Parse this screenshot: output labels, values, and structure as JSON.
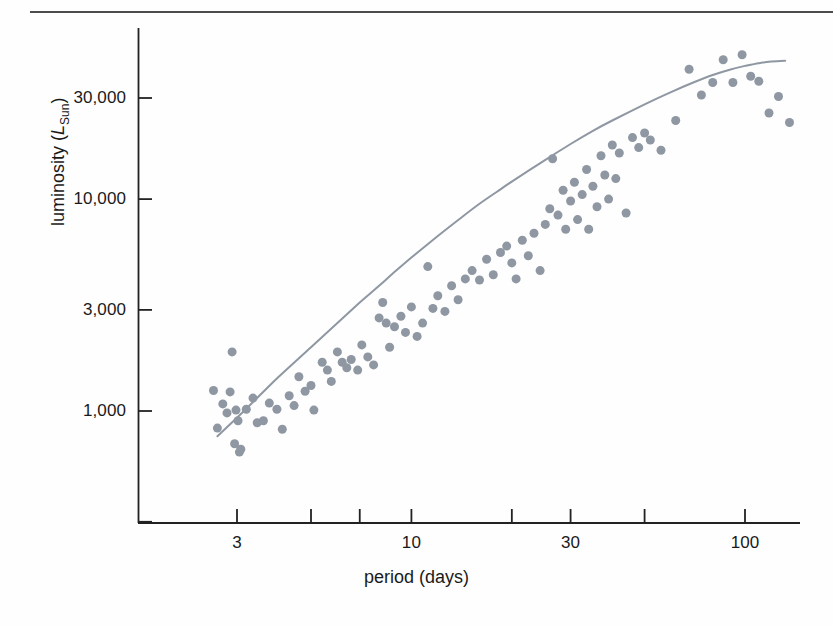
{
  "figure": {
    "kind": "scatter-plot",
    "background": "#fefefe",
    "rule_color": "#4c4c4c",
    "axis_color": "#222222",
    "point_color": "#8e97a2",
    "curve_color": "#8e97a2"
  },
  "axes": {
    "x_title": "period (days)",
    "y_title_prefix": "luminosity (",
    "y_title_symbol": "L",
    "y_title_subscript": "Sun",
    "y_title_suffix": ")"
  },
  "chart_data": {
    "type": "scatter",
    "title": "",
    "subtitle": "",
    "xlabel": "period (days)",
    "ylabel": "luminosity (L_Sun)",
    "xscale": "log",
    "yscale": "log",
    "xlim": [
      2.0,
      160
    ],
    "ylim": [
      330,
      120000
    ],
    "grid": false,
    "legend": null,
    "annotations": [],
    "xticks": [
      {
        "value": 3,
        "label": "3"
      },
      {
        "value": 5,
        "label": ""
      },
      {
        "value": 7,
        "label": ""
      },
      {
        "value": 10,
        "label": "10"
      },
      {
        "value": 20,
        "label": ""
      },
      {
        "value": 30,
        "label": "30"
      },
      {
        "value": 50,
        "label": ""
      },
      {
        "value": 100,
        "label": "100"
      }
    ],
    "yticks": [
      {
        "value": 100000,
        "label": ""
      },
      {
        "value": 30000,
        "label": "30,000"
      },
      {
        "value": 10000,
        "label": "10,000"
      },
      {
        "value": 3000,
        "label": "3,000"
      },
      {
        "value": 1000,
        "label": "1,000"
      },
      {
        "value": 300,
        "label": ""
      }
    ],
    "series": [
      {
        "name": "Cepheid variables",
        "marker": "circle",
        "marker_size_px": 9,
        "color": "#8e97a2",
        "points": [
          [
            2.55,
            1250
          ],
          [
            2.62,
            830
          ],
          [
            2.72,
            1080
          ],
          [
            2.8,
            980
          ],
          [
            2.86,
            1230
          ],
          [
            2.9,
            1900
          ],
          [
            2.95,
            700
          ],
          [
            2.98,
            1010
          ],
          [
            3.02,
            900
          ],
          [
            3.05,
            640
          ],
          [
            3.08,
            660
          ],
          [
            3.2,
            1020
          ],
          [
            3.35,
            1150
          ],
          [
            3.45,
            880
          ],
          [
            3.6,
            900
          ],
          [
            3.75,
            1090
          ],
          [
            3.95,
            1020
          ],
          [
            4.1,
            820
          ],
          [
            4.3,
            1180
          ],
          [
            4.45,
            1060
          ],
          [
            4.6,
            1450
          ],
          [
            4.8,
            1240
          ],
          [
            5.0,
            1320
          ],
          [
            5.1,
            1010
          ],
          [
            5.4,
            1700
          ],
          [
            5.6,
            1560
          ],
          [
            5.75,
            1380
          ],
          [
            6.0,
            1900
          ],
          [
            6.2,
            1700
          ],
          [
            6.4,
            1600
          ],
          [
            6.6,
            1750
          ],
          [
            6.9,
            1560
          ],
          [
            7.1,
            2050
          ],
          [
            7.4,
            1800
          ],
          [
            7.7,
            1650
          ],
          [
            8.0,
            2750
          ],
          [
            8.2,
            3250
          ],
          [
            8.4,
            2600
          ],
          [
            8.6,
            2000
          ],
          [
            8.9,
            2500
          ],
          [
            9.3,
            2800
          ],
          [
            9.6,
            2350
          ],
          [
            10.0,
            3100
          ],
          [
            10.4,
            2250
          ],
          [
            10.8,
            2600
          ],
          [
            11.2,
            4800
          ],
          [
            11.6,
            3050
          ],
          [
            12.0,
            3500
          ],
          [
            12.6,
            2950
          ],
          [
            13.2,
            3900
          ],
          [
            13.8,
            3350
          ],
          [
            14.5,
            4200
          ],
          [
            15.2,
            4600
          ],
          [
            16.0,
            4150
          ],
          [
            16.8,
            5200
          ],
          [
            17.6,
            4400
          ],
          [
            18.5,
            5600
          ],
          [
            19.3,
            6000
          ],
          [
            20.0,
            5000
          ],
          [
            20.6,
            4200
          ],
          [
            21.5,
            6400
          ],
          [
            22.4,
            5400
          ],
          [
            23.3,
            6900
          ],
          [
            24.3,
            4600
          ],
          [
            25.2,
            7600
          ],
          [
            26.0,
            9000
          ],
          [
            26.5,
            15500
          ],
          [
            27.5,
            8400
          ],
          [
            28.5,
            11000
          ],
          [
            29.0,
            7200
          ],
          [
            30.0,
            9800
          ],
          [
            30.8,
            12000
          ],
          [
            31.5,
            8000
          ],
          [
            32.5,
            10500
          ],
          [
            33.5,
            13800
          ],
          [
            34.0,
            7200
          ],
          [
            35.0,
            11500
          ],
          [
            36.0,
            9200
          ],
          [
            37.0,
            16000
          ],
          [
            38.0,
            13000
          ],
          [
            39.0,
            10000
          ],
          [
            40.0,
            18000
          ],
          [
            41.0,
            12500
          ],
          [
            42.0,
            16500
          ],
          [
            44.0,
            8600
          ],
          [
            46.0,
            19500
          ],
          [
            48.0,
            17500
          ],
          [
            50.0,
            20500
          ],
          [
            52.0,
            19000
          ],
          [
            56.0,
            17000
          ],
          [
            62.0,
            23500
          ],
          [
            68.0,
            41000
          ],
          [
            74.0,
            31000
          ],
          [
            80.0,
            35500
          ],
          [
            86.0,
            45500
          ],
          [
            92.0,
            35500
          ],
          [
            98.0,
            48000
          ],
          [
            104.0,
            38000
          ],
          [
            110.0,
            36000
          ],
          [
            118.0,
            25500
          ],
          [
            126.0,
            30500
          ],
          [
            136.0,
            23000
          ]
        ]
      }
    ],
    "fit_curve": {
      "name": "period-luminosity relation",
      "style": "solid",
      "color": "#8e97a2",
      "width_px": 2,
      "points": [
        [
          2.62,
          760
        ],
        [
          3.0,
          930
        ],
        [
          3.5,
          1180
        ],
        [
          4.0,
          1450
        ],
        [
          5.0,
          2000
        ],
        [
          6.0,
          2600
        ],
        [
          7.0,
          3250
        ],
        [
          8.0,
          3900
        ],
        [
          9.0,
          4600
        ],
        [
          10.0,
          5300
        ],
        [
          12.0,
          6700
        ],
        [
          14.0,
          8100
        ],
        [
          16.0,
          9500
        ],
        [
          18.0,
          10800
        ],
        [
          20.0,
          12100
        ],
        [
          25.0,
          15200
        ],
        [
          30.0,
          18200
        ],
        [
          35.0,
          21000
        ],
        [
          40.0,
          23500
        ],
        [
          50.0,
          28000
        ],
        [
          60.0,
          32000
        ],
        [
          70.0,
          35500
        ],
        [
          80.0,
          38500
        ],
        [
          90.0,
          40800
        ],
        [
          100.0,
          42500
        ],
        [
          110.0,
          43800
        ],
        [
          120.0,
          44600
        ],
        [
          132.0,
          45000
        ]
      ]
    }
  }
}
